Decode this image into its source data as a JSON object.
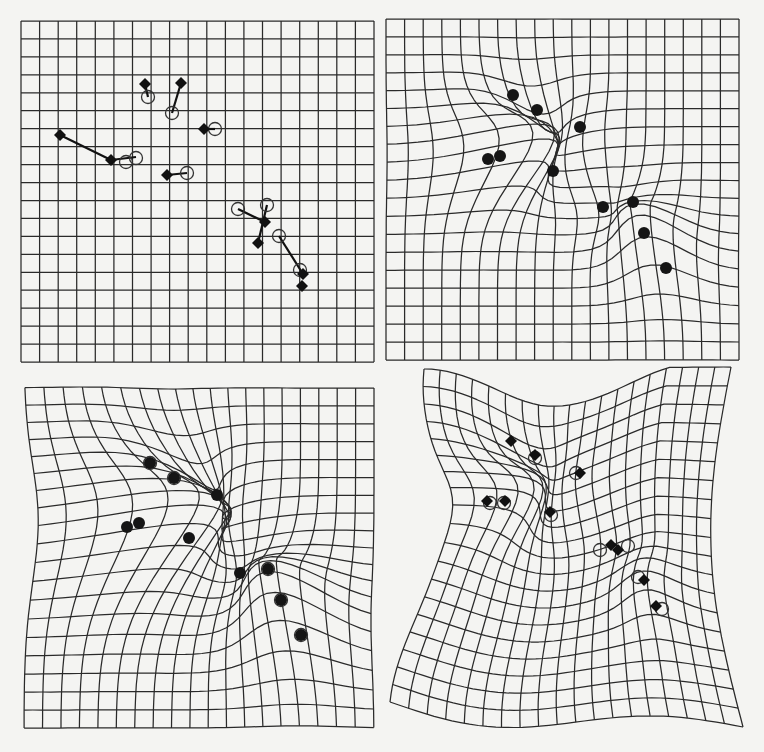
{
  "figure": {
    "colors": {
      "background": "#f4f4f2",
      "ink": "#2a2a2a",
      "marker": "#111111"
    },
    "panels": [
      {
        "id": "panel-top-left",
        "label": "undeformed grid with landmark displacement vectors",
        "type": "rect",
        "rect": [
          21,
          21,
          374,
          362
        ],
        "cols": 19,
        "rows": 19,
        "warps": [],
        "vectors": [
          [
            145,
            84,
            148,
            97
          ],
          [
            181,
            83,
            172,
            113
          ],
          [
            204,
            129,
            215,
            129
          ],
          [
            60,
            135,
            111,
            160
          ],
          [
            111,
            160,
            136,
            157
          ],
          [
            167,
            175,
            187,
            173
          ],
          [
            238,
            209,
            265,
            222
          ],
          [
            267,
            205,
            258,
            243
          ],
          [
            279,
            236,
            303,
            274
          ]
        ],
        "circles": [
          [
            148,
            97
          ],
          [
            172,
            113
          ],
          [
            215,
            129
          ],
          [
            126,
            162
          ],
          [
            136,
            158
          ],
          [
            187,
            173
          ],
          [
            238,
            209
          ],
          [
            267,
            205
          ],
          [
            279,
            236
          ],
          [
            300,
            270
          ]
        ],
        "diamonds": [
          [
            145,
            84
          ],
          [
            181,
            83
          ],
          [
            204,
            129
          ],
          [
            60,
            135
          ],
          [
            111,
            160
          ],
          [
            167,
            175
          ],
          [
            265,
            222
          ],
          [
            258,
            243
          ],
          [
            303,
            274
          ],
          [
            302,
            286
          ]
        ],
        "dots": []
      },
      {
        "id": "panel-top-right",
        "label": "deformed grid, landmarks only",
        "type": "rect",
        "rect": [
          386,
          19,
          739,
          360
        ],
        "cols": 19,
        "rows": 19,
        "warps": [
          [
            488,
            157,
            40,
            -18,
            38
          ],
          [
            500,
            160,
            20,
            -8,
            30
          ],
          [
            513,
            96,
            4,
            14,
            24
          ],
          [
            537,
            110,
            10,
            20,
            26
          ],
          [
            580,
            127,
            -8,
            4,
            24
          ],
          [
            553,
            171,
            -14,
            10,
            30
          ],
          [
            603,
            207,
            18,
            0,
            28
          ],
          [
            633,
            202,
            -18,
            14,
            26
          ],
          [
            644,
            233,
            -8,
            -24,
            28
          ],
          [
            666,
            268,
            -10,
            -26,
            30
          ]
        ],
        "vectors": [],
        "circles": [],
        "diamonds": [],
        "dots": [
          [
            513,
            95
          ],
          [
            537,
            110
          ],
          [
            580,
            127
          ],
          [
            488,
            159
          ],
          [
            500,
            156
          ],
          [
            553,
            171
          ],
          [
            603,
            207
          ],
          [
            633,
            202
          ],
          [
            644,
            233
          ],
          [
            666,
            268
          ]
        ]
      },
      {
        "id": "panel-bottom-left",
        "label": "deformed grid, stronger warp",
        "type": "rect",
        "rect": [
          24,
          388,
          374,
          728
        ],
        "cols": 19,
        "rows": 19,
        "warps": [
          [
            127,
            527,
            60,
            -24,
            60
          ],
          [
            139,
            524,
            30,
            -10,
            40
          ],
          [
            150,
            463,
            8,
            20,
            34
          ],
          [
            174,
            478,
            14,
            26,
            34
          ],
          [
            217,
            495,
            -12,
            8,
            32
          ],
          [
            189,
            538,
            -20,
            12,
            40
          ],
          [
            240,
            573,
            24,
            0,
            38
          ],
          [
            268,
            569,
            -24,
            18,
            36
          ],
          [
            281,
            600,
            -10,
            -30,
            38
          ],
          [
            301,
            635,
            -14,
            -32,
            40
          ]
        ],
        "vectors": [],
        "circles": [
          [
            150,
            463
          ],
          [
            174,
            478
          ],
          [
            281,
            600
          ],
          [
            301,
            635
          ],
          [
            268,
            569
          ]
        ],
        "diamonds": [],
        "dots": [
          [
            150,
            463
          ],
          [
            174,
            478
          ],
          [
            217,
            495
          ],
          [
            127,
            527
          ],
          [
            139,
            523
          ],
          [
            189,
            538
          ],
          [
            240,
            573
          ],
          [
            268,
            569
          ],
          [
            281,
            600
          ],
          [
            301,
            635
          ]
        ]
      },
      {
        "id": "panel-bottom-right",
        "label": "deformed grid with source circles and target diamonds",
        "type": "quad",
        "corners": {
          "tl": [
            424,
            369
          ],
          "tr": [
            731,
            367
          ],
          "bl": [
            390,
            702
          ],
          "br": [
            743,
            727
          ]
        },
        "bends": {
          "top": 38,
          "bottom": 22,
          "left": 34,
          "right": -26
        },
        "cols": 19,
        "rows": 19,
        "warps": [
          [
            487,
            501,
            26,
            -10,
            34
          ],
          [
            505,
            501,
            14,
            -6,
            26
          ],
          [
            511,
            441,
            4,
            8,
            24
          ],
          [
            535,
            455,
            6,
            10,
            24
          ],
          [
            578,
            473,
            -6,
            2,
            22
          ],
          [
            550,
            514,
            -8,
            6,
            26
          ],
          [
            617,
            549,
            6,
            0,
            24
          ],
          [
            644,
            580,
            -4,
            -10,
            24
          ],
          [
            657,
            607,
            -6,
            -12,
            24
          ]
        ],
        "vectors": [],
        "circles": [
          [
            490,
            503
          ],
          [
            504,
            503
          ],
          [
            535,
            458
          ],
          [
            576,
            473
          ],
          [
            551,
            515
          ],
          [
            600,
            550
          ],
          [
            628,
            546
          ],
          [
            638,
            577
          ],
          [
            662,
            609
          ]
        ],
        "diamonds": [
          [
            511,
            441
          ],
          [
            535,
            455
          ],
          [
            580,
            473
          ],
          [
            487,
            501
          ],
          [
            505,
            501
          ],
          [
            550,
            512
          ],
          [
            611,
            545
          ],
          [
            618,
            550
          ],
          [
            644,
            580
          ],
          [
            656,
            606
          ]
        ],
        "dots": []
      }
    ]
  }
}
